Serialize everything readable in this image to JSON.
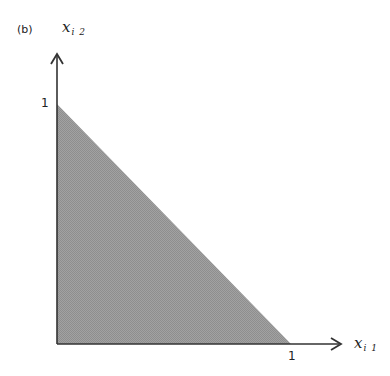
{
  "figure": {
    "panel_label": "(b)",
    "x_axis": {
      "label_main": "x",
      "label_sub": "i 1",
      "tick_label": "1"
    },
    "y_axis": {
      "label_main": "x",
      "label_sub": "i 2",
      "tick_label": "1"
    },
    "region": {
      "shape": "triangle",
      "vertices": [
        [
          0,
          0
        ],
        [
          1,
          0
        ],
        [
          0,
          1
        ]
      ],
      "fill": "#9a9a9a",
      "description": "shaded region x_i1 + x_i2 <= 1"
    },
    "colors": {
      "axis": "#333333",
      "fill": "#9a9a9a"
    }
  }
}
